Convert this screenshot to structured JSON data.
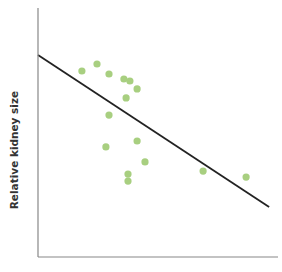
{
  "chart_data": {
    "type": "scatter",
    "title": "",
    "xlabel": "",
    "ylabel": "Relative kidney size",
    "grid": false,
    "legend": null,
    "xlim": [
      0,
      100
    ],
    "ylim": [
      0,
      100
    ],
    "x_ticks": [],
    "y_ticks": [],
    "points": [
      {
        "x": 18.3,
        "y": 74.7
      },
      {
        "x": 24.6,
        "y": 77.5
      },
      {
        "x": 29.6,
        "y": 73.5
      },
      {
        "x": 35.8,
        "y": 71.5
      },
      {
        "x": 38.3,
        "y": 70.7
      },
      {
        "x": 41.3,
        "y": 67.5
      },
      {
        "x": 36.7,
        "y": 63.9
      },
      {
        "x": 29.6,
        "y": 57.0
      },
      {
        "x": 28.3,
        "y": 44.2
      },
      {
        "x": 41.3,
        "y": 46.6
      },
      {
        "x": 44.6,
        "y": 38.2
      },
      {
        "x": 37.5,
        "y": 33.3
      },
      {
        "x": 37.5,
        "y": 30.5
      },
      {
        "x": 68.8,
        "y": 34.5
      },
      {
        "x": 86.7,
        "y": 32.1
      }
    ],
    "trendline": {
      "type": "linear",
      "start": {
        "x": 0,
        "y": 81.1
      },
      "end": {
        "x": 96.3,
        "y": 20.1
      }
    },
    "colors": {
      "points": "#a8cf80",
      "trendline": "#222222",
      "axes": "#888888"
    }
  },
  "plot_area": {
    "left": 38,
    "top": 8,
    "right": 278,
    "bottom": 257
  }
}
